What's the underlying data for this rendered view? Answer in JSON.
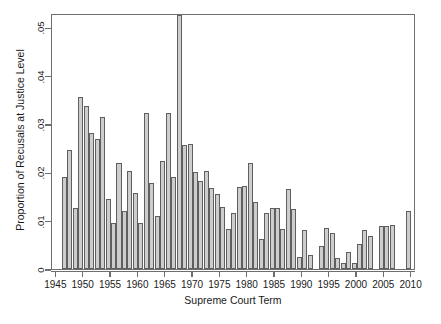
{
  "chart_data": {
    "type": "bar",
    "title": "",
    "xlabel": "Supreme Court Term",
    "ylabel": "Proportion of Recusals at Justice Level",
    "xlim": [
      1944.2,
      1910.0
    ],
    "x_range": [
      1944.2,
      2010.8
    ],
    "ylim": [
      0,
      0.053
    ],
    "grid": false,
    "legend": null,
    "xticks": [
      1945,
      1950,
      1955,
      1960,
      1965,
      1970,
      1975,
      1980,
      1985,
      1990,
      1995,
      2000,
      2005,
      2010
    ],
    "xtick_labels": [
      "1945",
      "1950",
      "1955",
      "1960",
      "1965",
      "1970",
      "1975",
      "1980",
      "1985",
      "1990",
      "1995",
      "2000",
      "2005",
      "2010"
    ],
    "yticks": [
      0,
      0.01,
      0.02,
      0.03,
      0.04,
      0.05
    ],
    "ytick_labels": [
      "0",
      ".01",
      ".02",
      ".03",
      ".04",
      ".05"
    ],
    "bar_color": "#cdcdcd",
    "bar_edge_color": "#5f5f5f",
    "categories": [
      1946,
      1947,
      1948,
      1949,
      1950,
      1951,
      1952,
      1953,
      1954,
      1955,
      1956,
      1957,
      1958,
      1959,
      1960,
      1961,
      1962,
      1963,
      1964,
      1965,
      1966,
      1967,
      1968,
      1969,
      1970,
      1971,
      1972,
      1973,
      1974,
      1975,
      1976,
      1977,
      1978,
      1979,
      1980,
      1981,
      1982,
      1983,
      1984,
      1985,
      1986,
      1987,
      1988,
      1989,
      1990,
      1991,
      1993,
      1994,
      1995,
      1996,
      1997,
      1998,
      1999,
      2000,
      2001,
      2002,
      2004,
      2005,
      2006,
      2009
    ],
    "values": [
      0.0191,
      0.0247,
      0.0127,
      0.0357,
      0.0337,
      0.0282,
      0.0269,
      0.0315,
      0.0145,
      0.0096,
      0.022,
      0.0121,
      0.0203,
      0.0157,
      0.0096,
      0.0322,
      0.0178,
      0.0109,
      0.0223,
      0.0322,
      0.0191,
      0.0525,
      0.0256,
      0.0258,
      0.02,
      0.0183,
      0.0203,
      0.0167,
      0.0155,
      0.0129,
      0.0082,
      0.0115,
      0.017,
      0.0172,
      0.0219,
      0.0138,
      0.0062,
      0.0115,
      0.0126,
      0.0127,
      0.0083,
      0.0165,
      0.0124,
      0.0024,
      0.008,
      0.0028,
      0.0047,
      0.0085,
      0.0075,
      0.0023,
      0.0012,
      0.0036,
      0.0013,
      0.0051,
      0.0081,
      0.0069,
      0.009,
      0.009,
      0.0092,
      0.0121
    ],
    "missing_years": [
      1945,
      1992,
      2003,
      2007,
      2008,
      2010
    ]
  },
  "axis": {
    "x_title": "Supreme Court Term",
    "y_title": "Proportion of Recusals at Justice Level"
  }
}
